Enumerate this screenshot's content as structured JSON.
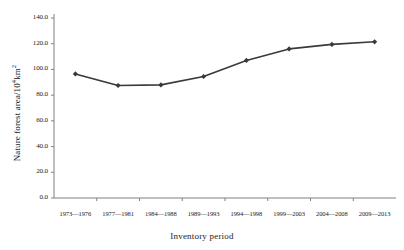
{
  "chart_data": {
    "type": "line",
    "title": "",
    "xlabel": "Inventory period",
    "ylabel": "Nature forest area/10⁴km²",
    "ylabel_main": "Nature forest area/10",
    "ylabel_sup": "4",
    "ylabel_tail": "km",
    "ylabel_tail_sup": "2",
    "categories": [
      "1973—1976",
      "1977—1981",
      "1984—1988",
      "1989—1993",
      "1994—1998",
      "1999—2003",
      "2004—2008",
      "2009—2013"
    ],
    "values": [
      96.5,
      87.5,
      88.0,
      94.5,
      107.0,
      116.0,
      119.5,
      121.5
    ],
    "ylim": [
      0.0,
      140.0
    ],
    "ytick_labels": [
      "0.0",
      "20.0",
      "40.0",
      "60.0",
      "80.0",
      "100.0",
      "120.0",
      "140.0"
    ],
    "ytick_values": [
      0,
      20,
      40,
      60,
      80,
      100,
      120,
      140
    ],
    "grid": false,
    "legend": "none",
    "series_color": "#3a3a3a",
    "marker": "diamond",
    "axis_color": "#808080"
  }
}
